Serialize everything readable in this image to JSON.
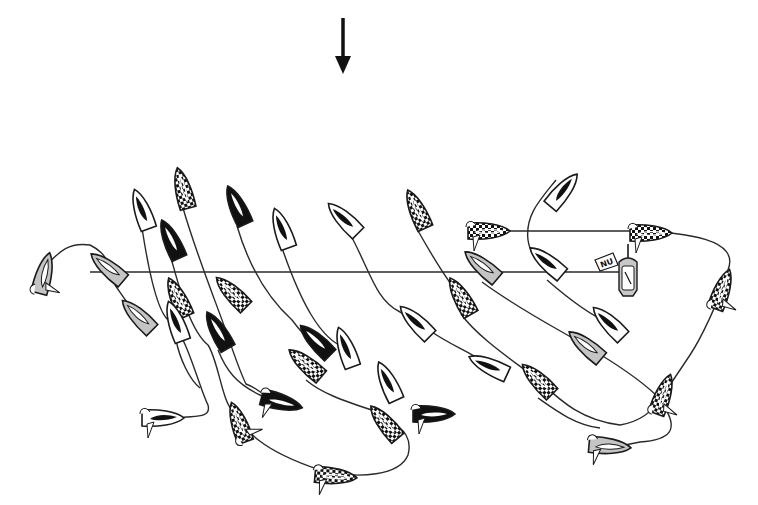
{
  "diagram": {
    "wind_arrow": {
      "label": "wind-direction",
      "x": 343,
      "y1": 18,
      "y2": 74
    },
    "start_line": {
      "x1": 90,
      "y1": 272,
      "x2": 622,
      "y2": 272
    },
    "committee_boat": {
      "x": 628,
      "y": 274,
      "flag_text": "NU",
      "fill": "#c8c8c8"
    },
    "colors": {
      "black": "#111111",
      "white": "#ffffff",
      "gray": "#c4c4c4",
      "stroke": "#1a1a1a"
    },
    "boats": [
      {
        "id": 1,
        "x": 142,
        "y": 210,
        "angle": -20,
        "style": "white"
      },
      {
        "id": 2,
        "x": 183,
        "y": 189,
        "angle": -15,
        "style": "checker"
      },
      {
        "id": 3,
        "x": 237,
        "y": 206,
        "angle": -25,
        "style": "black"
      },
      {
        "id": 4,
        "x": 282,
        "y": 229,
        "angle": -20,
        "style": "white"
      },
      {
        "id": 5,
        "x": 344,
        "y": 219,
        "angle": -45,
        "style": "white"
      },
      {
        "id": 6,
        "x": 417,
        "y": 210,
        "angle": -25,
        "style": "checker"
      },
      {
        "id": 7,
        "x": 171,
        "y": 240,
        "angle": -25,
        "style": "black"
      },
      {
        "id": 8,
        "x": 563,
        "y": 191,
        "angle": 40,
        "style": "white"
      },
      {
        "id": 9,
        "x": 488,
        "y": 231,
        "angle": 90,
        "style": "checker",
        "heeled": true
      },
      {
        "id": 10,
        "x": 650,
        "y": 233,
        "angle": 90,
        "style": "checker",
        "heeled": true
      },
      {
        "id": 11,
        "x": 547,
        "y": 262,
        "angle": -50,
        "style": "white"
      },
      {
        "id": 12,
        "x": 482,
        "y": 266,
        "angle": -50,
        "style": "gray"
      },
      {
        "id": 13,
        "x": 108,
        "y": 268,
        "angle": -50,
        "style": "gray"
      },
      {
        "id": 14,
        "x": 44,
        "y": 274,
        "angle": 15,
        "style": "gray",
        "heeled": true
      },
      {
        "id": 15,
        "x": 722,
        "y": 290,
        "angle": 20,
        "style": "checker",
        "heeled": true
      },
      {
        "id": 16,
        "x": 232,
        "y": 293,
        "angle": -45,
        "style": "checker"
      },
      {
        "id": 17,
        "x": 178,
        "y": 298,
        "angle": -25,
        "style": "checker"
      },
      {
        "id": 18,
        "x": 138,
        "y": 316,
        "angle": -45,
        "style": "gray"
      },
      {
        "id": 19,
        "x": 176,
        "y": 322,
        "angle": -20,
        "style": "white"
      },
      {
        "id": 20,
        "x": 218,
        "y": 331,
        "angle": -30,
        "style": "black"
      },
      {
        "id": 21,
        "x": 316,
        "y": 341,
        "angle": -45,
        "style": "black"
      },
      {
        "id": 22,
        "x": 346,
        "y": 348,
        "angle": -20,
        "style": "white"
      },
      {
        "id": 23,
        "x": 306,
        "y": 364,
        "angle": -50,
        "style": "checker"
      },
      {
        "id": 24,
        "x": 416,
        "y": 322,
        "angle": -45,
        "style": "white"
      },
      {
        "id": 25,
        "x": 461,
        "y": 297,
        "angle": -30,
        "style": "checker"
      },
      {
        "id": 26,
        "x": 609,
        "y": 323,
        "angle": -45,
        "style": "white"
      },
      {
        "id": 27,
        "x": 586,
        "y": 346,
        "angle": -50,
        "style": "gray"
      },
      {
        "id": 28,
        "x": 388,
        "y": 382,
        "angle": -25,
        "style": "white"
      },
      {
        "id": 29,
        "x": 489,
        "y": 366,
        "angle": -65,
        "style": "white"
      },
      {
        "id": 30,
        "x": 538,
        "y": 380,
        "angle": -45,
        "style": "checker"
      },
      {
        "id": 31,
        "x": 281,
        "y": 402,
        "angle": 105,
        "style": "black",
        "heeled": true
      },
      {
        "id": 32,
        "x": 663,
        "y": 395,
        "angle": 20,
        "style": "checker",
        "heeled": true
      },
      {
        "id": 33,
        "x": 433,
        "y": 414,
        "angle": 90,
        "style": "black",
        "heeled": true
      },
      {
        "id": 34,
        "x": 385,
        "y": 423,
        "angle": -40,
        "style": "checker"
      },
      {
        "id": 35,
        "x": 162,
        "y": 418,
        "angle": 90,
        "style": "white",
        "heeled": true
      },
      {
        "id": 36,
        "x": 239,
        "y": 423,
        "angle": -20,
        "style": "checker",
        "heeled": true
      },
      {
        "id": 37,
        "x": 609,
        "y": 446,
        "angle": 95,
        "style": "gray",
        "heeled": true
      },
      {
        "id": 38,
        "x": 335,
        "y": 476,
        "angle": 95,
        "style": "checker",
        "heeled": true
      }
    ],
    "tracks": [
      "M 142 228 C 150 280, 160 320, 172 322 C 188 340, 200 390, 208 405 C 212 420, 190 415, 180 418",
      "M 183 208 C 195 250, 215 300, 226 331 C 236 360, 240 372, 246 384 C 262 390, 266 398, 272 402",
      "M 237 226 C 250 270, 270 300, 292 320 C 300 330, 305 338, 316 341",
      "M 282 248 C 300 300, 320 340, 346 348",
      "M 349 232 C 370 270, 375 300, 400 312 C 408 318, 412 320, 416 322",
      "M 417 229 C 440 270, 455 290, 461 297",
      "M 171 258 C 180 290, 190 330, 208 345 C 218 360, 222 400, 232 410 C 245 430, 260 450, 320 470 C 360 480, 400 475, 408 455 C 412 440, 405 428, 390 423",
      "M 176 340 C 180 360, 190 380, 200 388",
      "M 429 330 C 450 345, 470 352, 480 360",
      "M 218 350 C 226 370, 236 384, 262 396",
      "M 306 380 C 320 392, 340 400, 378 412",
      "M 461 314 C 480 340, 520 365, 538 380 C 560 400, 580 420, 620 425 C 650 420, 660 400, 663 395",
      "M 482 282 C 520 310, 560 330, 586 346 C 610 360, 640 380, 656 395",
      "M 547 280 C 570 300, 590 315, 609 323",
      "M 556 180 C 540 200, 525 215, 528 240 C 530 255, 540 262, 547 262",
      "M 470 231 L 630 231 C 690 232, 740 240, 728 270 C 720 300, 700 340, 690 355 C 680 370, 670 385, 663 395",
      "M 663 405 C 680 430, 670 440, 640 442 L 620 446",
      "M 538 398 C 555 410, 575 425, 600 428",
      "M 44 268 C 60 250, 70 242, 90 245 C 100 250, 104 255, 108 262",
      "M 115 285 C 122 295, 126 302, 132 308"
    ]
  }
}
